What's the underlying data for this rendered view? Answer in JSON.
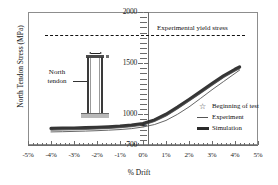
{
  "chart_data": {
    "type": "line",
    "title": "",
    "xlabel": "% Drift",
    "ylabel": "North Tendon Stress (MPa)",
    "xlim": [
      -5,
      5
    ],
    "ylim": [
      700,
      2000
    ],
    "grid": false,
    "legend_position": "center-right",
    "x_ticks": [
      "-5%",
      "-4%",
      "-3%",
      "-2%",
      "-1%",
      "0%",
      "1%",
      "2%",
      "3%",
      "4%",
      "5%"
    ],
    "x_tick_values": [
      -5,
      -4,
      -3,
      -2,
      -1,
      0,
      1,
      2,
      3,
      4,
      5
    ],
    "y_ticks": [
      "700",
      "1000",
      "1500",
      "2000"
    ],
    "y_tick_values": [
      700,
      1000,
      1500,
      2000
    ],
    "annotations": [
      {
        "name": "experimental-yield-stress",
        "label": "Experimental yield stress",
        "type": "hline",
        "value": 1810,
        "style": "dashed",
        "x_start": -4.3,
        "x_end": 4.2
      },
      {
        "name": "north-tendon-inset",
        "label": "North tendon",
        "type": "inset-sketch"
      }
    ],
    "markers": [
      {
        "name": "beginning-of-test",
        "label": "Beginning of test",
        "symbol": "star",
        "x": 0,
        "y": 900
      }
    ],
    "series": [
      {
        "name": "Experiment",
        "style": "thin-line",
        "color": "#555555",
        "x": [
          -4.0,
          -3.5,
          -3.0,
          -2.5,
          -2.0,
          -1.5,
          -1.0,
          -0.5,
          0.0,
          0.5,
          1.0,
          1.5,
          2.0,
          2.5,
          3.0,
          3.5,
          4.0,
          4.2
        ],
        "y": [
          828,
          830,
          833,
          836,
          840,
          845,
          851,
          860,
          876,
          900,
          940,
          1000,
          1072,
          1155,
          1240,
          1320,
          1400,
          1432
        ]
      },
      {
        "name": "Simulation",
        "style": "thick-band",
        "color": "#2a2a2a",
        "x": [
          -4.0,
          -3.5,
          -3.0,
          -2.5,
          -2.0,
          -1.5,
          -1.0,
          -0.5,
          0.0,
          0.5,
          1.0,
          1.5,
          2.0,
          2.5,
          3.0,
          3.5,
          4.0,
          4.2
        ],
        "y": [
          862,
          864,
          866,
          869,
          873,
          878,
          885,
          895,
          910,
          945,
          1000,
          1070,
          1145,
          1222,
          1300,
          1375,
          1440,
          1462
        ]
      }
    ]
  },
  "axes": {
    "y_title": "North Tendon Stress (MPa)",
    "x_title": "% Drift",
    "y_tick_labels": [
      "2000",
      "1500",
      "1000",
      "700"
    ],
    "x_tick_labels": [
      "-5%",
      "-4%",
      "-3%",
      "-2%",
      "-1%",
      "0%",
      "1%",
      "2%",
      "3%",
      "4%",
      "5%"
    ]
  },
  "annotation_text": {
    "yield": "Experimental yield stress",
    "inset_label_line1": "North",
    "inset_label_line2": "tendon"
  },
  "legend": {
    "items": [
      {
        "label": "Beginning of test",
        "mark": "star-icon"
      },
      {
        "label": "Experiment",
        "mark": "thin-line-icon"
      },
      {
        "label": "Simulation",
        "mark": "thick-bar-icon"
      }
    ]
  }
}
